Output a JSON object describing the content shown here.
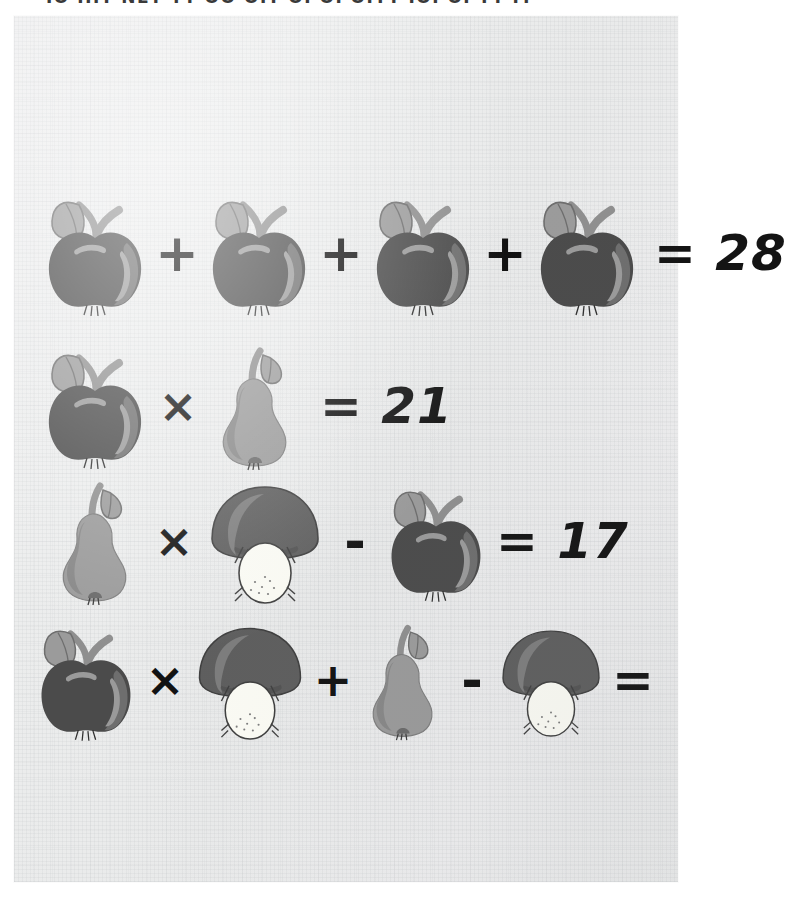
{
  "page": {
    "top_cut_text": "IO HIT NET TT OO      OIT OI OI OITT IOI OI TT IT",
    "background_color": "#ebecec",
    "ink_color": "#121212"
  },
  "palette": {
    "apple_body": "#4b4b4b",
    "apple_shade": "#6e6e6e",
    "apple_highlight": "#9a9a9a",
    "leaf": "#9b9b9b",
    "stem": "#8f8f8f",
    "pear_body": "#9a9a9a",
    "pear_shade": "#8a8a8a",
    "mushroom_cap": "#5e5e5e",
    "mushroom_cap_highlight": "#7d7d7d",
    "mushroom_stem": "#fbfbf4",
    "outline": "#3f3f3f"
  },
  "puzzle": {
    "type": "fruit-algebra",
    "symbols": {
      "apple": "apple-icon",
      "pear": "pear-icon",
      "mushroom": "mushroom-icon"
    },
    "equations": [
      {
        "id": "equation-1",
        "tokens": [
          "apple",
          "+",
          "apple",
          "+",
          "apple",
          "+",
          "apple"
        ],
        "equals_label": "=",
        "result": "28",
        "result_text": "= 28",
        "solved": true
      },
      {
        "id": "equation-2",
        "tokens": [
          "apple",
          "×",
          "pear"
        ],
        "equals_label": "=",
        "result": "21",
        "result_text": "= 21",
        "solved": true
      },
      {
        "id": "equation-3",
        "tokens": [
          "pear",
          "×",
          "mushroom",
          "-",
          "apple"
        ],
        "equals_label": "=",
        "result": "17",
        "result_text": "= 17",
        "solved": true
      },
      {
        "id": "equation-4",
        "tokens": [
          "apple",
          "×",
          "mushroom",
          "+",
          "pear",
          "-",
          "mushroom"
        ],
        "equals_label": "=",
        "result": "",
        "result_text": "=",
        "solved": false
      }
    ],
    "operators": {
      "plus": "+",
      "times": "×",
      "minus": "-",
      "equals": "="
    }
  }
}
